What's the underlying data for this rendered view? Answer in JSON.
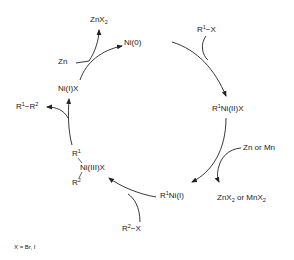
{
  "diagram": {
    "type": "catalytic-cycle",
    "species": {
      "ni0": {
        "label": "Ni(0)"
      },
      "r1ni2x": {
        "pre": "R",
        "sup": "1",
        "post": "Ni(II)X"
      },
      "r1ni1": {
        "pre": "R",
        "sup": "1",
        "post": "Ni(I)"
      },
      "ni3": {
        "r1_pre": "R",
        "r1_sup": "1",
        "center": "Ni(III)X",
        "r2_pre": "R",
        "r2_sup": "2"
      },
      "ni1x": {
        "label": "Ni(I)X"
      }
    },
    "reagents": {
      "r1x": {
        "pre": "R",
        "sup": "1",
        "post": "−X"
      },
      "zn_or_mn": {
        "label": "Zn or Mn"
      },
      "znx2_or_mnx2": {
        "a": "ZnX",
        "a_sub": "2",
        "mid": " or MnX",
        "b_sub": "2"
      },
      "r2x": {
        "pre": "R",
        "sup": "2",
        "post": "−X"
      },
      "r1r2": {
        "pre": "R",
        "sup1": "1",
        "mid": "−R",
        "sup2": "2"
      },
      "zn": {
        "label": "Zn"
      },
      "znx2": {
        "pre": "ZnX",
        "sub": "2"
      }
    },
    "footnote": "X = Br, I",
    "colors": {
      "ink": "#222222",
      "background": "#ffffff"
    }
  }
}
